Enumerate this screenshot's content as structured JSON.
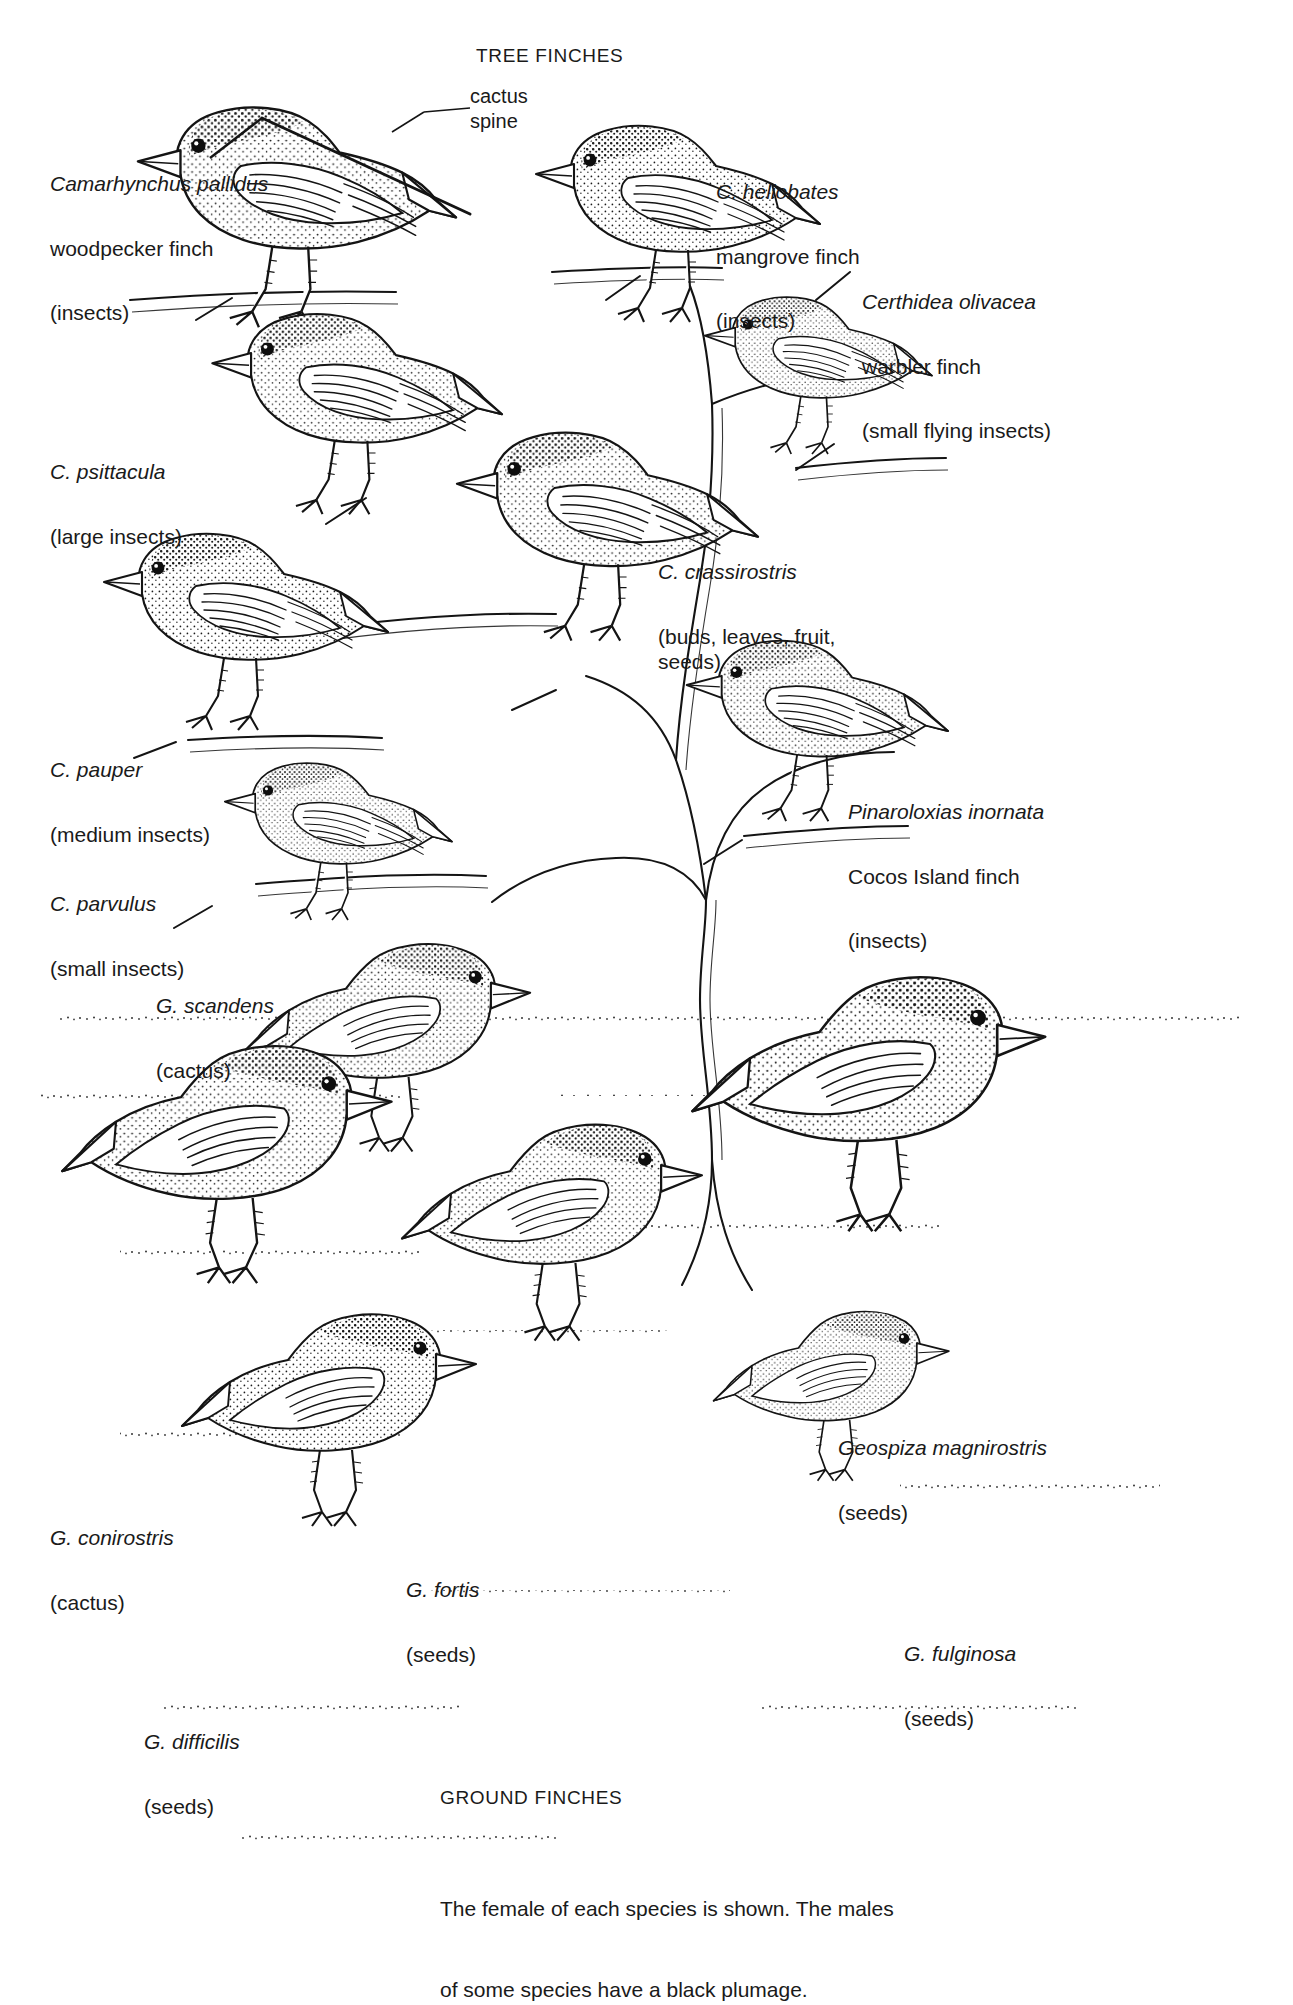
{
  "figure": {
    "title_top": "TREE FINCHES",
    "title_bottom": "GROUND FINCHES",
    "caption_line1": "The female of each species is shown. The males",
    "caption_line2": "of some species have a black plumage.",
    "callout": {
      "line1": "cactus",
      "line2": "spine"
    },
    "ink": "#151515",
    "paper": "#ffffff"
  },
  "tree_finches": [
    {
      "id": "woodpecker-finch",
      "species": "Camarhynchus pallidus",
      "common": "woodpecker finch",
      "diet": "(insects)"
    },
    {
      "id": "mangrove-finch",
      "species": "C. heliobates",
      "common": "mangrove finch",
      "diet": "(insects)"
    },
    {
      "id": "warbler-finch",
      "species": "Certhidea olivacea",
      "common": "warbler finch",
      "diet": "(small flying insects)"
    },
    {
      "id": "psittacula",
      "species": "C. psittacula",
      "common": "",
      "diet": "(large insects)"
    },
    {
      "id": "crassirostris",
      "species": "C. crassirostris",
      "common": "",
      "diet": "(buds, leaves, fruit,\nseeds)"
    },
    {
      "id": "pauper",
      "species": "C. pauper",
      "common": "",
      "diet": "(medium insects)"
    },
    {
      "id": "cocos-island-finch",
      "species": "Pinaroloxias inornata",
      "common": "Cocos Island finch",
      "diet": "(insects)"
    },
    {
      "id": "parvulus",
      "species": "C. parvulus",
      "common": "",
      "diet": "(small insects)"
    }
  ],
  "ground_finches": [
    {
      "id": "scandens",
      "species": "G. scandens",
      "common": "",
      "diet": "(cactus)"
    },
    {
      "id": "magnirostris",
      "species": "Geospiza magnirostris",
      "common": "",
      "diet": "(seeds)"
    },
    {
      "id": "conirostris",
      "species": "G. conirostris",
      "common": "",
      "diet": "(cactus)"
    },
    {
      "id": "fortis",
      "species": "G. fortis",
      "common": "",
      "diet": "(seeds)"
    },
    {
      "id": "fulginosa",
      "species": "G. fulginosa",
      "common": "",
      "diet": "(seeds)"
    },
    {
      "id": "difficilis",
      "species": "G. difficilis",
      "common": "",
      "diet": "(seeds)"
    }
  ]
}
